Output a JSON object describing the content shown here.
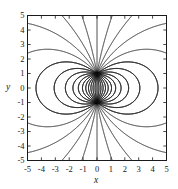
{
  "chart_data": {
    "type": "line",
    "title": "",
    "subtitle": "",
    "xlabel": "x",
    "ylabel": "y",
    "xlim": [
      -5,
      5
    ],
    "ylim": [
      -5,
      5
    ],
    "xticks": [
      -5,
      -4,
      -3,
      -2,
      -1,
      0,
      1,
      2,
      3,
      4,
      5
    ],
    "yticks": [
      -5,
      -4,
      -3,
      -2,
      -1,
      0,
      1,
      2,
      3,
      4,
      5
    ],
    "xtick_labels": [
      "-5",
      "-4",
      "-3",
      "-2",
      "-1",
      "0",
      "1",
      "2",
      "3",
      "4",
      "5"
    ],
    "ytick_labels": [
      "-5",
      "-4",
      "-3",
      "-2",
      "-1",
      "0",
      "1",
      "2",
      "3",
      "4",
      "5"
    ],
    "grid": false,
    "legend": null,
    "legend_position": "none",
    "frame": true,
    "line_color": "#111111",
    "background_color": "#ffffff",
    "singular_points": [
      {
        "x": 0,
        "y": 1,
        "kind": "source"
      },
      {
        "x": 0,
        "y": -1,
        "kind": "sink"
      }
    ],
    "n_field_lines": 64,
    "series": [
      {
        "name": "field-lines-upper-point",
        "origin": [
          0,
          1
        ],
        "n_lines": 32,
        "angles_deg": [
          0,
          11.25,
          22.5,
          33.75,
          45,
          56.25,
          67.5,
          78.75,
          90,
          101.25,
          112.5,
          123.75,
          135,
          146.25,
          157.5,
          168.75,
          180,
          191.25,
          202.5,
          213.75,
          225,
          236.25,
          247.5,
          258.75,
          270,
          281.25,
          292.5,
          303.75,
          315,
          326.25,
          337.5,
          348.75
        ]
      },
      {
        "name": "field-lines-lower-point",
        "origin": [
          0,
          -1
        ],
        "n_lines": 32,
        "angles_deg": [
          0,
          11.25,
          22.5,
          33.75,
          45,
          56.25,
          67.5,
          78.75,
          90,
          101.25,
          112.5,
          123.75,
          135,
          146.25,
          157.5,
          168.75,
          180,
          191.25,
          202.5,
          213.75,
          225,
          236.25,
          247.5,
          258.75,
          270,
          281.25,
          292.5,
          303.75,
          315,
          326.25,
          337.5,
          348.75
        ]
      }
    ]
  }
}
